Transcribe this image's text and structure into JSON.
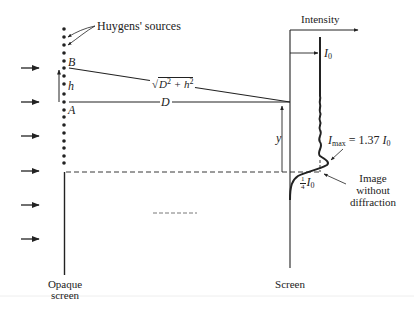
{
  "diagram": {
    "labels": {
      "huygens_sources": "Huygens' sources",
      "point_b": "B",
      "point_a": "A",
      "height": "h",
      "distance_slant": "D² + h²",
      "distance_slant_base": "D",
      "distance_slant_h": "h",
      "distance": "D",
      "intensity_axis": "Intensity",
      "i0": "I",
      "i0_sub": "0",
      "imax_prefix": "I",
      "imax_sub": "max",
      "imax_eq": " = 1.37 ",
      "imax_i": "I",
      "imax_i_sub": "0",
      "quarter_num": "1",
      "quarter_den": "4",
      "quarter_i": "I",
      "quarter_i_sub": "0",
      "y_offset": "y",
      "image_without_diffraction_1": "Image",
      "image_without_diffraction_2": "without",
      "image_without_diffraction_3": "diffraction",
      "opaque_screen_1": "Opaque",
      "opaque_screen_2": "screen",
      "screen": "Screen"
    },
    "incident_arrows_y": [
      68,
      102,
      136,
      171,
      205,
      239
    ],
    "source_dots": {
      "x": 64,
      "y_start": 28,
      "y_end": 163,
      "count": 18
    },
    "values": {
      "imax_ratio": 1.37,
      "edge_ratio": 0.25
    },
    "colors": {
      "ink": "#222222",
      "background": "#ffffff"
    }
  }
}
